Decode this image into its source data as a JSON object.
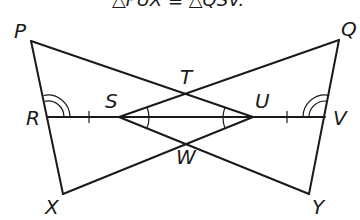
{
  "caption": "△PUX ≅ △QSV.",
  "points": {
    "P": {
      "label": "P",
      "x": 31,
      "y": 41
    },
    "Q": {
      "label": "Q",
      "x": 339,
      "y": 40
    },
    "R": {
      "label": "R",
      "x": 48,
      "y": 117
    },
    "S": {
      "label": "S",
      "x": 119,
      "y": 117
    },
    "T": {
      "label": "T",
      "x": 186,
      "y": 93
    },
    "U": {
      "label": "U",
      "x": 253,
      "y": 117
    },
    "V": {
      "label": "V",
      "x": 325,
      "y": 117
    },
    "W": {
      "label": "W",
      "x": 186,
      "y": 143
    },
    "X": {
      "label": "X",
      "x": 63,
      "y": 194
    },
    "Y": {
      "label": "Y",
      "x": 309,
      "y": 194
    }
  },
  "segments": [
    [
      "P",
      "X"
    ],
    [
      "P",
      "U"
    ],
    [
      "X",
      "U"
    ],
    [
      "Q",
      "Y"
    ],
    [
      "Q",
      "S"
    ],
    [
      "Y",
      "S"
    ],
    [
      "R",
      "V"
    ]
  ],
  "marks": {
    "congruent_segments": [
      "RS",
      "UV"
    ],
    "double_arc_angles": [
      "PRS",
      "QVU"
    ],
    "single_arc_angles": [
      "TSU",
      "WSU",
      "TUS",
      "WUS"
    ]
  },
  "colors": {
    "stroke": "#1a1a1a",
    "background": "#ffffff"
  }
}
